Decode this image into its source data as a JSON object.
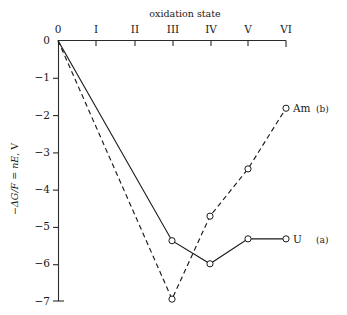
{
  "chart_data": {
    "type": "line",
    "title": "",
    "xlabel": "oxidation state",
    "ylabel": "−ΔG/F = nE, V",
    "categories": [
      "0",
      "I",
      "II",
      "III",
      "IV",
      "V",
      "VI"
    ],
    "x": [
      0,
      1,
      2,
      3,
      4,
      5,
      6
    ],
    "xlim": [
      0,
      6
    ],
    "ylim": [
      -7,
      0
    ],
    "yticks": [
      0,
      -1,
      -2,
      -3,
      -4,
      -5,
      -6,
      -7
    ],
    "ytick_labels": [
      "0",
      "−1",
      "−2",
      "−3",
      "−4",
      "−5",
      "−6",
      "−7"
    ],
    "grid": false,
    "legend": "inline-end-labels",
    "xaxis_position": "top",
    "series": [
      {
        "name": "U",
        "label": "U",
        "sublabel": "(a)",
        "style": "solid",
        "color": "#1a1a1a",
        "points": [
          {
            "x": 0,
            "y": 0.0,
            "marker": false
          },
          {
            "x": 3,
            "y": -5.38,
            "marker": true
          },
          {
            "x": 4,
            "y": -6.0,
            "marker": true
          },
          {
            "x": 5,
            "y": -5.33,
            "marker": true
          },
          {
            "x": 6,
            "y": -5.33,
            "marker": true
          }
        ]
      },
      {
        "name": "Am",
        "label": "Am",
        "sublabel": "(b)",
        "style": "dashed",
        "color": "#1a1a1a",
        "points": [
          {
            "x": 0,
            "y": 0.0,
            "marker": false
          },
          {
            "x": 3,
            "y": -6.95,
            "marker": true
          },
          {
            "x": 4,
            "y": -4.72,
            "marker": true
          },
          {
            "x": 5,
            "y": -3.45,
            "marker": true
          },
          {
            "x": 6,
            "y": -1.82,
            "marker": true
          }
        ]
      }
    ]
  },
  "labels": {
    "xaxis_title": "oxidation state",
    "ytitle_parts": {
      "minus": "−",
      "delta_g": "ΔG",
      "slash_f": "/F",
      "equals": " = ",
      "ne": "nE",
      "comma_v": ", V"
    }
  }
}
